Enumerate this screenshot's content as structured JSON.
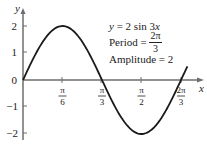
{
  "chart_data": {
    "type": "line",
    "title": "",
    "function": "y = 2 sin 3x",
    "xlabel": "x",
    "ylabel": "y",
    "xlim": [
      0,
      2.1
    ],
    "ylim": [
      -2.3,
      2.3
    ],
    "x_ticks": [
      {
        "value": 0.5236,
        "num": "π",
        "den": "6"
      },
      {
        "value": 1.0472,
        "num": "π",
        "den": "3"
      },
      {
        "value": 1.5708,
        "num": "π",
        "den": "2"
      },
      {
        "value": 2.0944,
        "num": "2π",
        "den": "3"
      }
    ],
    "y_ticks": [
      {
        "value": 2,
        "label": "2"
      },
      {
        "value": 1,
        "label": "1"
      },
      {
        "value": 0,
        "label": "0"
      },
      {
        "value": -1,
        "label": "−1"
      },
      {
        "value": -2,
        "label": "−2"
      }
    ],
    "series": [
      {
        "name": "y = 2 sin 3x",
        "x": [
          0,
          0.2618,
          0.5236,
          0.7854,
          1.0472,
          1.309,
          1.5708,
          1.8326,
          2.0944,
          2.18
        ],
        "values": [
          0,
          1.414,
          2,
          1.414,
          0,
          -1.414,
          -2,
          -1.414,
          0,
          0.52
        ]
      }
    ],
    "annotations": [
      {
        "text": "y = 2 sin 3x"
      },
      {
        "text": "Period = 2π/3"
      },
      {
        "text": "Amplitude = 2"
      }
    ],
    "grid": false,
    "legend": "none"
  },
  "annotation": {
    "equation_y": "y",
    "equation_rest": " = 2 sin 3",
    "equation_x": "x",
    "period_label": "Period = ",
    "period_num": "2π",
    "period_den": "3",
    "amplitude": "Amplitude = 2"
  },
  "axes": {
    "x_label": "x",
    "y_label": "y"
  },
  "colors": {
    "curve": "#1a1a1a",
    "axis": "#6e6e6e",
    "text": "#222222"
  }
}
